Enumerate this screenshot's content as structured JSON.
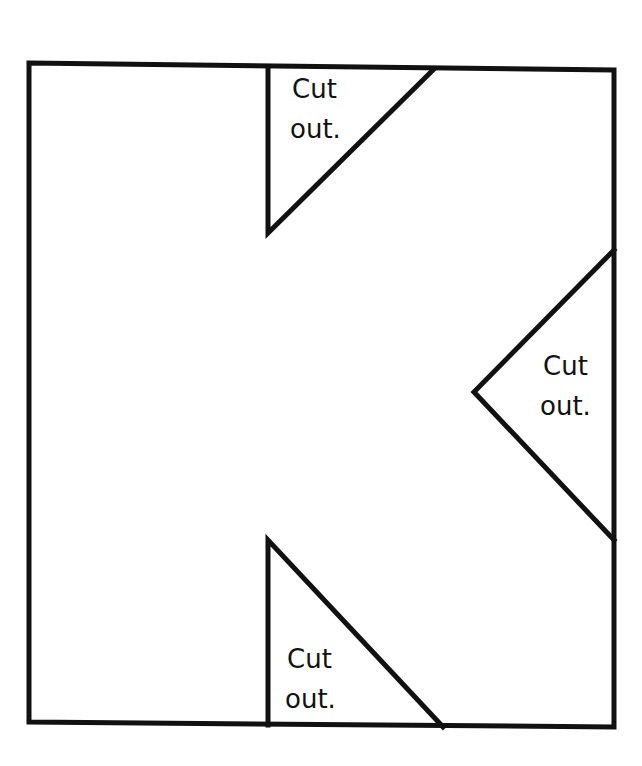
{
  "diagram": {
    "colors": {
      "stroke": "#111111",
      "background": "#ffffff"
    },
    "rectangle": {
      "points": [
        [
          29,
          63
        ],
        [
          614,
          70
        ],
        [
          614,
          727
        ],
        [
          29,
          722
        ]
      ]
    },
    "cutouts": [
      {
        "id": "top",
        "points": [
          [
            268,
            68
          ],
          [
            433,
            70
          ],
          [
            268,
            233
          ]
        ],
        "label_line1": "Cut",
        "label_line2": "out.",
        "label_pos": [
          292,
          113
        ]
      },
      {
        "id": "right",
        "points": [
          [
            614,
            250
          ],
          [
            474,
            392
          ],
          [
            614,
            540
          ]
        ],
        "label_line1": "Cut",
        "label_line2": "out.",
        "label_pos": [
          542,
          375
        ]
      },
      {
        "id": "bottom",
        "points": [
          [
            268,
            540
          ],
          [
            268,
            725
          ],
          [
            443,
            727
          ]
        ],
        "label_line1": "Cut",
        "label_line2": "out.",
        "label_pos": [
          287,
          668
        ]
      }
    ]
  }
}
